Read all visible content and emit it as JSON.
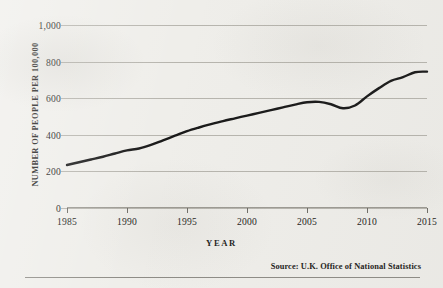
{
  "figure": {
    "x_axis_title": "YEAR",
    "y_axis_title": "NUMBER OF PEOPLE PER 100,000",
    "source_note": "Source: U.K. Office of National Statistics"
  },
  "chart_data": {
    "type": "line",
    "title": "",
    "subtitle": "",
    "xlabel": "YEAR",
    "ylabel": "NUMBER OF PEOPLE PER 100,000",
    "xlim": [
      1985,
      2015
    ],
    "ylim": [
      0,
      1000
    ],
    "grid": true,
    "legend": "none",
    "line_color": "#1a1a1a",
    "line_width_px": 2.4,
    "x_tick_labels": [
      "1985",
      "1990",
      "1995",
      "2000",
      "2005",
      "2010",
      "2015"
    ],
    "x_ticks": [
      1985,
      1990,
      1995,
      2000,
      2005,
      2010,
      2015
    ],
    "y_tick_labels": [
      "0",
      "200",
      "400",
      "600",
      "800",
      "1,000"
    ],
    "y_ticks": [
      0,
      200,
      400,
      600,
      800,
      1000
    ],
    "series": [
      {
        "name": "Number of people per 100,000",
        "x": [
          1985,
          1986,
          1987,
          1988,
          1989,
          1990,
          1991,
          1992,
          1993,
          1994,
          1995,
          1996,
          1997,
          1998,
          1999,
          2000,
          2001,
          2002,
          2003,
          2004,
          2005,
          2006,
          2007,
          2008,
          2009,
          2010,
          2011,
          2012,
          2013,
          2014,
          2015
        ],
        "values": [
          235,
          250,
          265,
          280,
          298,
          315,
          325,
          345,
          370,
          395,
          420,
          440,
          458,
          475,
          490,
          505,
          520,
          535,
          550,
          565,
          578,
          580,
          567,
          545,
          560,
          610,
          655,
          695,
          715,
          742,
          745
        ]
      }
    ],
    "annotations": [
      "Steady rise from about 235 in 1985 to a plateau near 580 in 2005-2006",
      "Dip to about 545 in 2008",
      "Sharp climb to about 745 by 2014, flat through 2015"
    ]
  }
}
